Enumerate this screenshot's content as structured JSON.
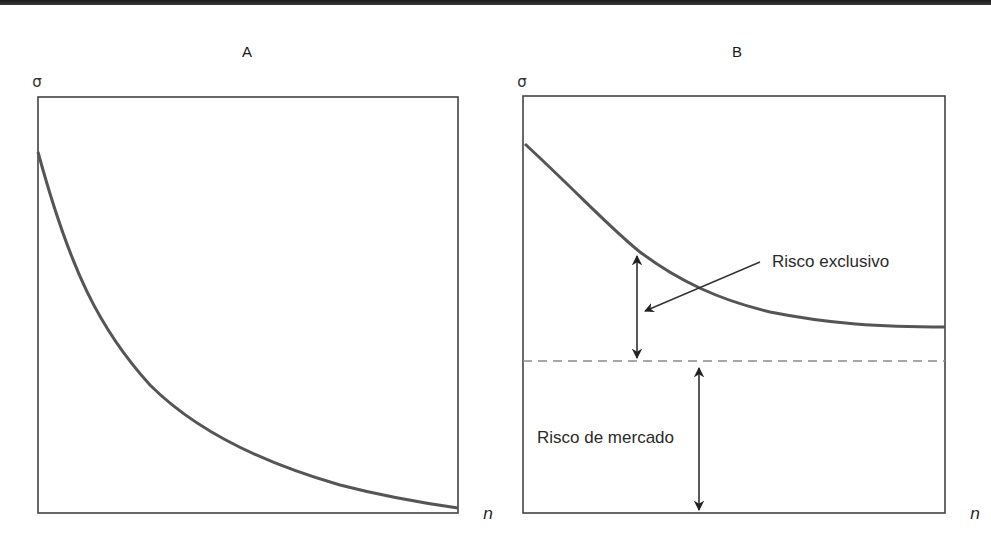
{
  "figure": {
    "panels": [
      {
        "id": "A",
        "title": "A",
        "y_axis_label": "σ",
        "x_axis_label": "n",
        "curve": "total risk decreasing convexly toward zero as n grows"
      },
      {
        "id": "B",
        "title": "B",
        "y_axis_label": "σ",
        "x_axis_label": "n",
        "curve": "total risk decreasing and leveling off at an asymptote above the market-risk line",
        "annotations": {
          "unique_risk": "Risco exclusivo",
          "market_risk": "Risco de mercado"
        }
      }
    ]
  },
  "colors": {
    "curve": "#555555",
    "frame": "#444444",
    "dashed_line": "#8a8a8a",
    "arrows": "#222222",
    "top_band": "#1a1a1a"
  }
}
